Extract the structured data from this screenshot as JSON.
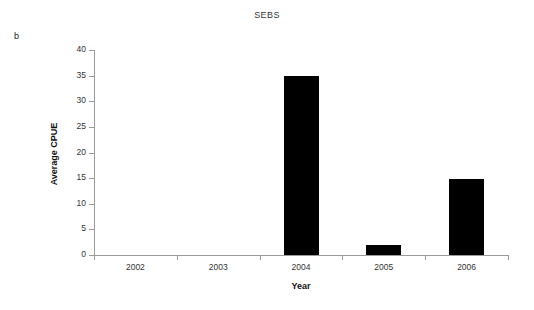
{
  "panel": {
    "label": "b"
  },
  "chart_data": {
    "type": "bar",
    "title": "SEBS",
    "xlabel": "Year",
    "ylabel": "Average CPUE",
    "categories": [
      "2002",
      "2003",
      "2004",
      "2005",
      "2006"
    ],
    "values": [
      0,
      0,
      34.9,
      2.0,
      14.8
    ],
    "ylim": [
      0,
      40
    ],
    "yticks": [
      0,
      5,
      10,
      15,
      20,
      25,
      30,
      35,
      40
    ],
    "ytick_labels": [
      "0",
      "5",
      "10",
      "15",
      "20",
      "25",
      "30",
      "35",
      "40"
    ],
    "grid": false,
    "legend": false,
    "bar_color": "#000000",
    "axis_color": "#9a9a9a"
  }
}
